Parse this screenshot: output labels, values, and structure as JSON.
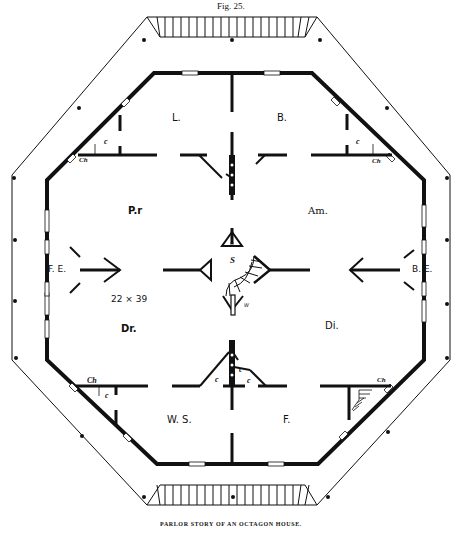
{
  "figure": {
    "number_label": "Fig. 25.",
    "caption": "PARLOR STORY OF AN OCTAGON HOUSE."
  },
  "rooms": {
    "library": "L.",
    "bedroom": "B.",
    "parlor": "P.r",
    "amusement": "Am.",
    "drawing": "Dr.",
    "dining": "Di.",
    "wash_sink": "W. S.",
    "f_room": "F.",
    "front_entry": "F. E.",
    "back_entry": "B. E.",
    "dimensions": "22 × 39"
  },
  "markers": {
    "closet": "c",
    "chimney": "Ch",
    "stairs": "S",
    "hall": "H",
    "window": "W"
  },
  "colors": {
    "ink": "#111111",
    "paper": "#ffffff"
  }
}
